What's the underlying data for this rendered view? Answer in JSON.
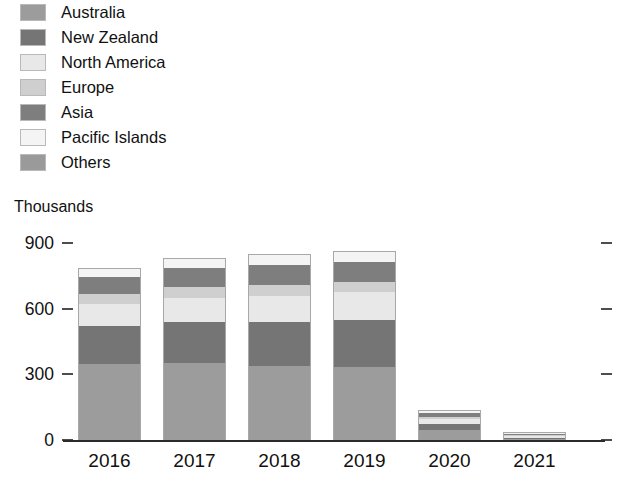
{
  "chart_data": {
    "type": "bar",
    "stacked": true,
    "title": "",
    "subtitle": "",
    "xlabel": "",
    "ylabel": "Thousands",
    "units_caption": "Thousands",
    "categories": [
      "2016",
      "2017",
      "2018",
      "2019",
      "2020",
      "2021"
    ],
    "ylim": [
      0,
      900
    ],
    "yticks": [
      0,
      300,
      600,
      900
    ],
    "ytick_labels": [
      "0",
      "300",
      "600",
      "900"
    ],
    "grid": false,
    "legend_position": "top-left",
    "series": [
      {
        "name": "Australia",
        "color": "#9c9c9c",
        "values": [
          345,
          350,
          340,
          335,
          45,
          6
        ]
      },
      {
        "name": "New Zealand",
        "color": "#757575",
        "values": [
          175,
          190,
          200,
          215,
          30,
          4
        ]
      },
      {
        "name": "North America",
        "color": "#e8e8e8",
        "values": [
          100,
          110,
          120,
          125,
          20,
          2
        ]
      },
      {
        "name": "Europe",
        "color": "#cfcfcf",
        "values": [
          45,
          50,
          50,
          45,
          10,
          1
        ]
      },
      {
        "name": "Asia",
        "color": "#7e7e7e",
        "values": [
          80,
          85,
          90,
          95,
          20,
          2
        ]
      },
      {
        "name": "Pacific Islands",
        "color": "#f4f4f4",
        "values": [
          35,
          40,
          45,
          45,
          5,
          1
        ]
      },
      {
        "name": "Others",
        "color": "#9a9a9a",
        "values": [
          5,
          5,
          5,
          5,
          2,
          1
        ]
      }
    ],
    "totals": [
      785,
      830,
      850,
      865,
      132,
      17
    ]
  },
  "legend": {
    "items": [
      {
        "label": "Australia",
        "color": "#9c9c9c"
      },
      {
        "label": "New Zealand",
        "color": "#757575"
      },
      {
        "label": "North America",
        "color": "#e8e8e8"
      },
      {
        "label": "Europe",
        "color": "#cfcfcf"
      },
      {
        "label": "Asia",
        "color": "#7e7e7e"
      },
      {
        "label": "Pacific Islands",
        "color": "#f4f4f4"
      },
      {
        "label": "Others",
        "color": "#9a9a9a"
      }
    ]
  },
  "axis": {
    "units_caption": "Thousands",
    "baseline_color": "#2b2b2b",
    "tick_color": "#4d4d4d"
  }
}
